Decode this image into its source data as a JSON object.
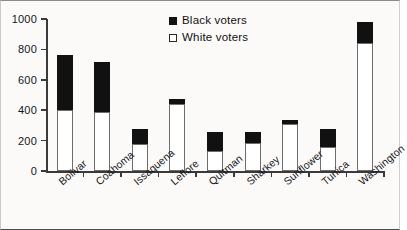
{
  "chart_data": {
    "type": "bar",
    "subtype": "stacked-vertical",
    "title": "",
    "xlabel": "",
    "ylabel": "",
    "ylim": [
      0,
      1000
    ],
    "yticks": [
      0,
      200,
      400,
      600,
      800,
      1000
    ],
    "grid": false,
    "legend_position": "top-center",
    "categories": [
      "Bolivar",
      "Coahoma",
      "Issaquena",
      "Leflore",
      "Quitman",
      "Sharkey",
      "Sunflower",
      "Tunica",
      "Washington"
    ],
    "series": [
      {
        "name": "White voters",
        "color": "#ffffff",
        "values": [
          400,
          385,
          175,
          440,
          130,
          185,
          310,
          155,
          840
        ]
      },
      {
        "name": "Black voters",
        "color": "#111111",
        "values": [
          360,
          335,
          100,
          35,
          125,
          70,
          25,
          120,
          140
        ]
      }
    ],
    "totals": [
      760,
      720,
      275,
      475,
      255,
      255,
      335,
      275,
      980
    ]
  },
  "legend": {
    "items": [
      {
        "label": "Black voters",
        "swatch": "filled-square",
        "color": "#111111"
      },
      {
        "label": "White voters",
        "swatch": "open-square",
        "color": "#ffffff"
      }
    ]
  },
  "axes": {
    "y_tick_labels": [
      "0",
      "200",
      "400",
      "600",
      "800",
      "1000"
    ]
  }
}
